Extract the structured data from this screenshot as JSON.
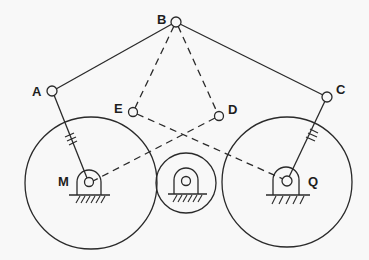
{
  "diagram": {
    "title": "",
    "type": "linkage-mechanism",
    "colors": {
      "line": "#2a2a2a",
      "background": "#f8f8f8"
    },
    "joints": [
      {
        "id": "A",
        "label": "A",
        "x": 52,
        "y": 91
      },
      {
        "id": "B",
        "label": "B",
        "x": 176,
        "y": 22
      },
      {
        "id": "C",
        "label": "C",
        "x": 327,
        "y": 97
      },
      {
        "id": "D",
        "label": "D",
        "x": 219,
        "y": 116
      },
      {
        "id": "E",
        "label": "E",
        "x": 133,
        "y": 112
      }
    ],
    "pivots": [
      {
        "id": "M",
        "label": "M",
        "x": 89,
        "y": 182
      },
      {
        "id": "center",
        "label": "",
        "x": 186,
        "y": 182
      },
      {
        "id": "Q",
        "label": "Q",
        "x": 287,
        "y": 181
      }
    ],
    "gears": [
      {
        "id": "left-gear",
        "cx": 91,
        "cy": 183,
        "r": 66
      },
      {
        "id": "center-gear",
        "cx": 186,
        "cy": 183,
        "r": 30
      },
      {
        "id": "right-gear",
        "cx": 287,
        "cy": 182,
        "r": 65
      }
    ],
    "solid_links": [
      {
        "from": "A",
        "to": "B"
      },
      {
        "from": "B",
        "to": "C"
      },
      {
        "from": "A",
        "to": "M"
      },
      {
        "from": "C",
        "to": "Q"
      }
    ],
    "dashed_links": [
      {
        "from": "B",
        "to": "E"
      },
      {
        "from": "B",
        "to": "D"
      },
      {
        "from": "E",
        "to": "Q"
      },
      {
        "from": "D",
        "to": "M"
      }
    ],
    "labels": {
      "A": "A",
      "B": "B",
      "C": "C",
      "D": "D",
      "E": "E",
      "M": "M",
      "Q": "Q"
    }
  }
}
